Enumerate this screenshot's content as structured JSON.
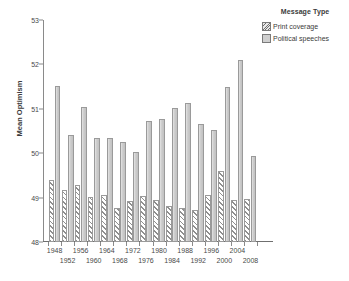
{
  "chart_data": {
    "type": "bar",
    "title": "",
    "xlabel": "",
    "ylabel": "Mean Optimism",
    "ylim": [
      48,
      53
    ],
    "yticks": [
      48,
      49,
      50,
      51,
      52,
      53
    ],
    "grid": false,
    "legend_position": "top-right",
    "legend_title": "Message Type",
    "categories": [
      "1948",
      "1952",
      "1956",
      "1960",
      "1964",
      "1968",
      "1972",
      "1976",
      "1980",
      "1984",
      "1988",
      "1992",
      "1996",
      "2000",
      "2004",
      "2008"
    ],
    "series": [
      {
        "name": "Print coverage",
        "pattern": "diagonal-hatch",
        "color": "#e6e6e6",
        "values": [
          49.4,
          49.18,
          49.29,
          49.02,
          49.05,
          48.76,
          48.93,
          49.04,
          48.94,
          48.82,
          48.77,
          48.73,
          49.05,
          49.61,
          48.94,
          48.97
        ]
      },
      {
        "name": "Political speeches",
        "pattern": "solid",
        "color": "#cfcfcf",
        "values": [
          51.52,
          50.41,
          51.03,
          50.34,
          50.34,
          50.26,
          50.03,
          50.73,
          50.76,
          51.02,
          51.12,
          50.65,
          50.53,
          51.5,
          52.11,
          49.94
        ]
      }
    ]
  },
  "legend": {
    "title": "Message Type",
    "items": [
      {
        "label": "Print coverage",
        "swatch": "hatch"
      },
      {
        "label": "Political speeches",
        "swatch": "solid"
      }
    ]
  },
  "axes": {
    "y_label": "Mean Optimism",
    "y_ticks": [
      "48",
      "49",
      "50",
      "51",
      "52",
      "53"
    ],
    "x_labels_top": [
      "1948",
      "1956",
      "1964",
      "1972",
      "1980",
      "1988",
      "1996",
      "2004"
    ],
    "x_labels_bottom": [
      "1952",
      "1960",
      "1968",
      "1976",
      "1984",
      "1992",
      "2000",
      "2008"
    ]
  },
  "caption": {
    "text": ""
  }
}
